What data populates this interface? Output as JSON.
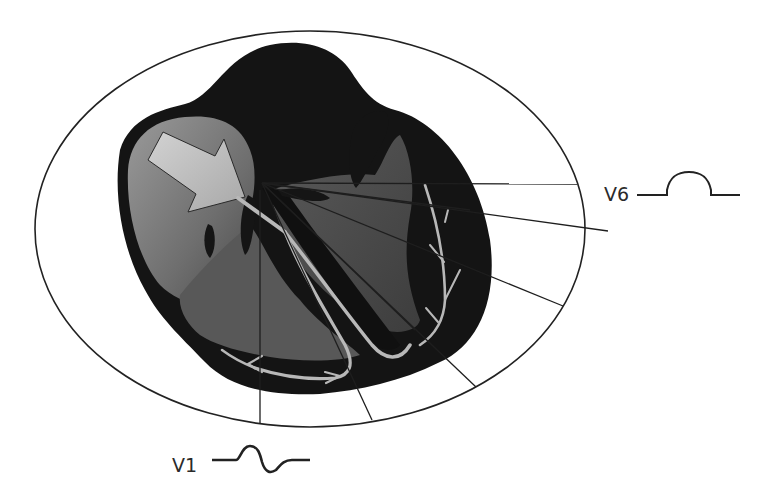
{
  "diagram": {
    "leads": [
      {
        "id": "V6",
        "label": "V6",
        "waveform": "positive-deflection"
      },
      {
        "id": "V1",
        "label": "V1",
        "waveform": "biphasic-rs"
      }
    ],
    "elements": {
      "torso_outline": "ellipse",
      "heart": "dark heart silhouette",
      "right_atrium": "gray gradient chamber",
      "left_ventricle": "dark gray chamber",
      "arrow": "depolarization arrow from right atrium toward AV node",
      "conduction_pathways": [
        "bundle of His",
        "right bundle branch",
        "left bundle branch",
        "Purkinje fibres"
      ],
      "lead_vector_lines": 8
    },
    "colors": {
      "background": "#ffffff",
      "outline": "#222222",
      "heart_dark": "#141414",
      "chamber_gray": "#5a5a5a",
      "atrium_light": "#8a8a8a",
      "arrow_fill": "#bdbdbd",
      "pathway": "#b5b5b5"
    }
  }
}
